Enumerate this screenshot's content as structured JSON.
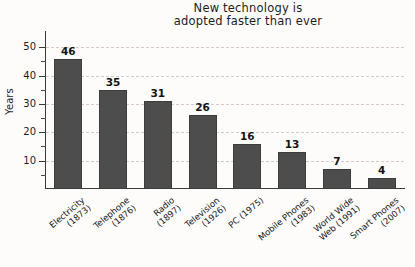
{
  "chart_data": {
    "type": "bar",
    "title": "New technology is\nadopted faster than ever",
    "title_line1": "New technology is",
    "title_line2": "adopted faster than ever",
    "xlabel": "",
    "ylabel": "Years",
    "ylim": [
      0,
      55
    ],
    "grid": true,
    "legend": "none",
    "bar_color": "#4d4d4d",
    "gridline_color": "#d8c9cc",
    "axis_color": "#3a3a3a",
    "background_color": "#fdfcfb",
    "ytick_values": [
      10,
      20,
      30,
      40,
      50
    ],
    "ytick_labels": [
      "10",
      "20",
      "30",
      "40",
      "50"
    ],
    "yminor_ticks": [
      5,
      15,
      25,
      35,
      45
    ],
    "categories": [
      "Electricity\n(1873)",
      "Telephone\n(1876)",
      "Radio\n(1897)",
      "Television\n(1926)",
      "PC (1975)",
      "Mobile Phones\n(1983)",
      "World Wide\nWeb (1991)",
      "Smart Phones\n(2007)"
    ],
    "values": [
      46,
      35,
      31,
      26,
      16,
      13,
      7,
      4
    ],
    "value_labels": [
      "46",
      "35",
      "31",
      "26",
      "16",
      "13",
      "7",
      "4"
    ]
  }
}
